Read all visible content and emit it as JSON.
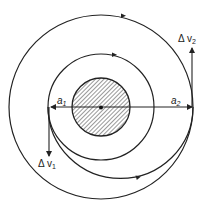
{
  "diagram": {
    "colors": {
      "stroke": "#222222",
      "background": "#ffffff",
      "hatch": "#333333"
    },
    "center": {
      "x": 101,
      "y": 107
    },
    "central_body": {
      "radius": 29,
      "fill": "hatched"
    },
    "orbits": [
      {
        "name": "inner-orbit",
        "radius": 53,
        "direction": "counter-clockwise"
      },
      {
        "name": "outer-orbit",
        "radius": 92,
        "direction": "counter-clockwise"
      }
    ],
    "transfer_orbit": {
      "from": "a1",
      "to": "a2",
      "direction": "counter-clockwise"
    },
    "labels": {
      "a1": {
        "base": "a",
        "sub": "1"
      },
      "a2": {
        "base": "a",
        "sub": "2"
      },
      "dv1": {
        "base": "Δ v",
        "sub": "1"
      },
      "dv2": {
        "base": "Δ v",
        "sub": "2"
      }
    }
  }
}
